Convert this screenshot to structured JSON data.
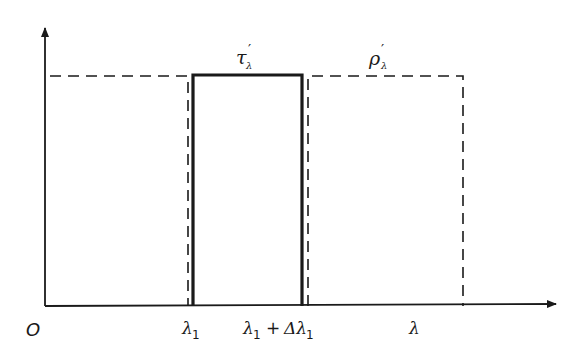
{
  "diagram": {
    "origin_label": "O",
    "x_axis_label": "λ",
    "ticks": [
      {
        "id": "lambda1",
        "label": "λ₁"
      },
      {
        "id": "lambda1_plus_delta",
        "label": "λ₁ + Δλ₁"
      }
    ],
    "curves": [
      {
        "id": "transmittance",
        "label": "τ′λ",
        "style": "solid",
        "band": [
          "λ₁",
          "λ₁ + Δλ₁"
        ]
      },
      {
        "id": "reflectance",
        "label": "ρ′λ",
        "style": "dashed",
        "band": [
          "0–λ₁",
          "λ₁ + Δλ₁ – λ"
        ]
      }
    ],
    "labels": {
      "tau_main": "τ",
      "tau_prime": "′",
      "tau_sub": "λ",
      "rho_main": "ρ",
      "rho_prime": "′",
      "rho_sub": "λ",
      "lambda1_main": "λ",
      "lambda1_sub": "1",
      "plus": "+",
      "delta": "Δλ",
      "delta_sub": "1"
    },
    "colors": {
      "ink": "#1a1a1a",
      "background": "#ffffff"
    }
  }
}
